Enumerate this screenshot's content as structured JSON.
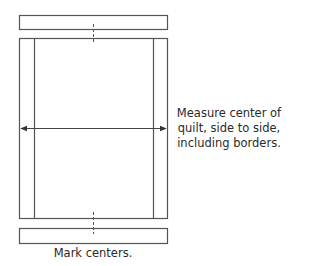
{
  "diagram": {
    "stroke_color": "#555555",
    "shapes": {
      "top_border_strip": {
        "x": 19,
        "y": 15,
        "w": 148,
        "h": 14
      },
      "quilt_top": {
        "x": 19,
        "y": 38,
        "w": 148,
        "h": 180
      },
      "left_border_line_x": 34,
      "right_border_line_x": 153,
      "bottom_border_strip": {
        "x": 19,
        "y": 228,
        "w": 148,
        "h": 15
      },
      "center_x": 93,
      "measure_arrow_y": 128
    },
    "measure_note": {
      "lines": [
        "Measure center of",
        "quilt, side to side,",
        "including borders."
      ]
    },
    "caption": "Mark centers."
  }
}
